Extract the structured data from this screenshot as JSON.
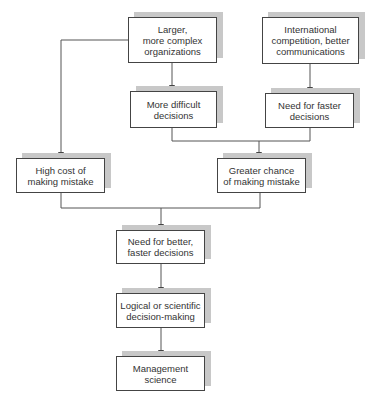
{
  "diagram": {
    "type": "flowchart",
    "colors": {
      "line": "#555555",
      "box_border": "#444444",
      "shadow": "#c8c8c8",
      "text": "#333333"
    },
    "nodes": {
      "larger_orgs": {
        "label": "Larger, more complex organizations",
        "lines": [
          "Larger,",
          "more complex",
          "organizations"
        ]
      },
      "intl_competition": {
        "label": "International competition, better communications",
        "lines": [
          "International",
          "competition, better",
          "communications"
        ]
      },
      "more_difficult": {
        "label": "More difficult decisions",
        "lines": [
          "More difficult",
          "decisions"
        ]
      },
      "need_faster": {
        "label": "Need for faster decisions",
        "lines": [
          "Need for faster",
          "decisions"
        ]
      },
      "high_cost": {
        "label": "High cost of making mistake",
        "lines": [
          "High cost of",
          "making mistake"
        ]
      },
      "greater_chance": {
        "label": "Greater chance of making mistake",
        "lines": [
          "Greater chance",
          "of making mistake"
        ]
      },
      "need_better_faster": {
        "label": "Need for better, faster decisions",
        "lines": [
          "Need for better,",
          "faster decisions"
        ]
      },
      "logical_scientific": {
        "label": "Logical or scientific decision-making",
        "lines": [
          "Logical or scientific",
          "decision-making"
        ]
      },
      "management_science": {
        "label": "Management science",
        "lines": [
          "Management",
          "science"
        ]
      }
    },
    "edges": [
      {
        "from": "larger_orgs",
        "to": "more_difficult"
      },
      {
        "from": "larger_orgs",
        "to": "high_cost"
      },
      {
        "from": "intl_competition",
        "to": "need_faster"
      },
      {
        "from": "more_difficult",
        "to": "greater_chance"
      },
      {
        "from": "need_faster",
        "to": "greater_chance"
      },
      {
        "from": "high_cost",
        "to": "need_better_faster"
      },
      {
        "from": "greater_chance",
        "to": "need_better_faster"
      },
      {
        "from": "need_better_faster",
        "to": "logical_scientific"
      },
      {
        "from": "logical_scientific",
        "to": "management_science"
      }
    ]
  }
}
